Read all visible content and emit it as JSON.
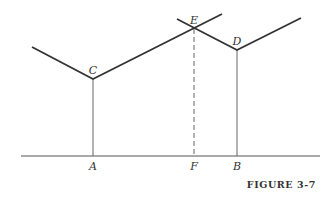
{
  "figure": {
    "caption": "FIGURE 3-7",
    "colors": {
      "line": "#333333",
      "background": "#ffffff"
    },
    "points": {
      "C": {
        "label": "C",
        "x": 93,
        "y": 79
      },
      "D": {
        "label": "D",
        "x": 237,
        "y": 50
      },
      "E": {
        "label": "E",
        "x": 194,
        "y": 29
      },
      "A": {
        "label": "A",
        "x": 93,
        "y": 156
      },
      "F": {
        "label": "F",
        "x": 194,
        "y": 156
      },
      "B": {
        "label": "B",
        "x": 237,
        "y": 156
      }
    },
    "segments": [
      {
        "name": "curve-c-left",
        "from": [
          32,
          47
        ],
        "to": [
          93,
          79
        ],
        "style": "thick"
      },
      {
        "name": "curve-c-right",
        "from": [
          93,
          79
        ],
        "to": [
          222,
          14
        ],
        "style": "thick"
      },
      {
        "name": "curve-d-left",
        "from": [
          177,
          19
        ],
        "to": [
          237,
          50
        ],
        "style": "thick"
      },
      {
        "name": "curve-d-right",
        "from": [
          237,
          50
        ],
        "to": [
          301,
          18
        ],
        "style": "thick"
      },
      {
        "name": "vertical-ca",
        "from": [
          93,
          79
        ],
        "to": [
          93,
          156
        ],
        "style": "thin"
      },
      {
        "name": "vertical-ef",
        "from": [
          194,
          29
        ],
        "to": [
          194,
          156
        ],
        "style": "dashed"
      },
      {
        "name": "vertical-db",
        "from": [
          237,
          50
        ],
        "to": [
          237,
          156
        ],
        "style": "thin"
      },
      {
        "name": "baseline",
        "from": [
          21,
          156
        ],
        "to": [
          320,
          156
        ],
        "style": "thin"
      }
    ]
  }
}
